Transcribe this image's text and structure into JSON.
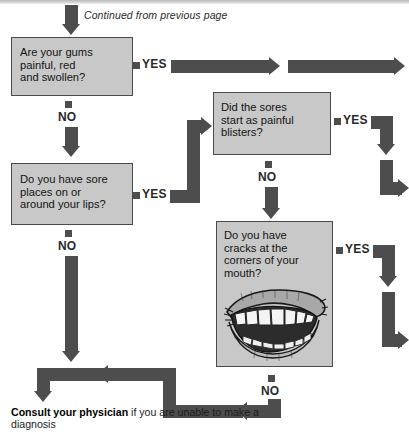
{
  "page": {
    "caption": "Continued from previous page",
    "answer_yes": "YES",
    "answer_no": "NO"
  },
  "boxes": [
    {
      "id": "gums",
      "text": "Are your gums\npainful, red\nand swollen?",
      "yes_label": "YES",
      "no_label": "NO"
    },
    {
      "id": "lips",
      "text": "Do you have sore\nplaces on or\naround your lips?",
      "yes_label": "YES",
      "no_label": "NO"
    },
    {
      "id": "blisters",
      "text": "Did the sores\nstart as painful\nblisters?",
      "yes_label": "YES",
      "no_label": "NO"
    },
    {
      "id": "cracks",
      "text": "Do you have\ncracks at the\ncorners of your\nmouth?",
      "yes_label": "YES",
      "no_label": "NO"
    }
  ],
  "labels": {
    "yes_gums": "YES",
    "no_gums": "NO",
    "yes_lips": "YES",
    "no_lips": "NO",
    "yes_blisters": "YES",
    "no_blisters": "NO",
    "yes_cracks": "YES",
    "no_cracks": "NO"
  },
  "advice": {
    "bold": "Consult your physician",
    "rest": " if you are unable to make a diagnosis"
  },
  "icons": {
    "mouth": "smiling-mouth-illustration",
    "arrow_down": "arrow-down-icon",
    "arrow_right": "arrow-right-icon",
    "arrow_left": "arrow-left-icon"
  },
  "colors": {
    "box_fill": "#c8c8c8",
    "box_border": "#4a4a4a",
    "arrow": "#4d4d4d",
    "text": "#141414",
    "background": "#ffffff"
  }
}
